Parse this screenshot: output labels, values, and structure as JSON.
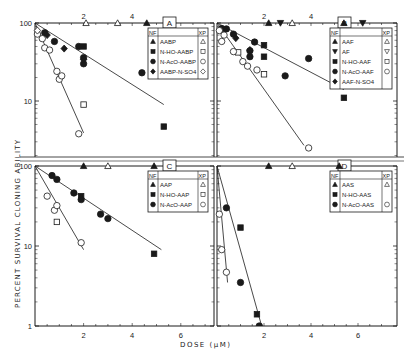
{
  "figure": {
    "ylabel": "PERCENT SURVIVAL CLONING ABILITY",
    "xlabel": "DOSE (μM)"
  },
  "chart_data": [
    {
      "panel": "A",
      "type": "scatter",
      "title": "A",
      "xlabel": "DOSE (μM)",
      "ylabel": "PERCENT SURVIVAL CLONING ABILITY",
      "yscale": "log",
      "xlim": [
        0,
        7.5
      ],
      "ylim": [
        3,
        100
      ],
      "x_ticks_labeled": [
        2,
        4
      ],
      "y_ticks_labeled": [
        10,
        100
      ],
      "legend_headers": [
        "NF",
        "XP"
      ],
      "series": [
        {
          "name": "AABP",
          "cell": "NF",
          "marker": "filled-triangle",
          "x": [
            4.6
          ],
          "y": [
            100
          ]
        },
        {
          "name": "AABP",
          "cell": "XP",
          "marker": "open-triangle",
          "x": [
            2.1,
            3.4
          ],
          "y": [
            100,
            100
          ]
        },
        {
          "name": "N-HO-AABP",
          "cell": "NF",
          "marker": "filled-square",
          "x": [
            2.0,
            5.3
          ],
          "y": [
            50,
            4.7
          ]
        },
        {
          "name": "N-HO-AABP",
          "cell": "XP",
          "marker": "open-square",
          "x": [
            2.0
          ],
          "y": [
            9
          ]
        },
        {
          "name": "N-AcO-AABP",
          "cell": "NF",
          "marker": "filled-circle",
          "x": [
            0.4,
            0.8,
            1.8,
            2.0,
            2.0,
            4.4
          ],
          "y": [
            75,
            58,
            50,
            36,
            30,
            23
          ]
        },
        {
          "name": "N-AcO-AABP",
          "cell": "XP",
          "marker": "open-circle",
          "x": [
            0.1,
            0.3,
            0.4,
            0.6,
            0.9,
            1.0,
            1.1,
            1.8
          ],
          "y": [
            72,
            63,
            48,
            45,
            24,
            19,
            21,
            3.8
          ]
        },
        {
          "name": "AABP-N-SO4",
          "cell": "NF",
          "marker": "filled-diamond",
          "x": [
            0.5,
            1.2,
            2.0
          ],
          "y": [
            70,
            47,
            34
          ]
        },
        {
          "name": "AABP-N-SO4",
          "cell": "XP",
          "marker": "open-diamond",
          "x": [
            0.1
          ],
          "y": [
            80
          ]
        }
      ],
      "fit_lines": [
        {
          "cell": "NF",
          "x": [
            0,
            5.3
          ],
          "y": [
            100,
            9
          ]
        },
        {
          "cell": "XP",
          "x": [
            0,
            2.0
          ],
          "y": [
            100,
            3.9
          ]
        }
      ]
    },
    {
      "panel": "B",
      "type": "scatter",
      "title": "B",
      "yscale": "log",
      "xlim": [
        0,
        7.5
      ],
      "ylim": [
        2,
        100
      ],
      "x_ticks_labeled": [
        2,
        4
      ],
      "legend_headers": [
        "NF",
        "XP"
      ],
      "series": [
        {
          "name": "AAF",
          "cell": "NF",
          "marker": "filled-triangle",
          "x": [
            2.2,
            5.4
          ],
          "y": [
            100,
            100
          ]
        },
        {
          "name": "AAF",
          "cell": "XP",
          "marker": "open-triangle",
          "x": [
            3.2
          ],
          "y": [
            100
          ]
        },
        {
          "name": "AF",
          "cell": "NF",
          "marker": "filled-inverted-triangle",
          "x": [
            2.7,
            6.2
          ],
          "y": [
            100,
            100
          ]
        },
        {
          "name": "AF",
          "cell": "XP",
          "marker": "open-inverted-triangle",
          "x": [],
          "y": []
        },
        {
          "name": "N-HO-AAF",
          "cell": "NF",
          "marker": "filled-square",
          "x": [
            2.0,
            2.0,
            5.4
          ],
          "y": [
            52,
            37,
            11
          ]
        },
        {
          "name": "N-HO-AAF",
          "cell": "XP",
          "marker": "open-square",
          "x": [
            0.9,
            2.0
          ],
          "y": [
            42,
            22
          ]
        },
        {
          "name": "N-AcO-AAF",
          "cell": "NF",
          "marker": "filled-circle",
          "x": [
            0.2,
            0.4,
            0.7,
            1.6,
            1.4,
            1.4,
            2.9,
            3.9
          ],
          "y": [
            85,
            84,
            72,
            57,
            44,
            37,
            21,
            35
          ]
        },
        {
          "name": "N-AcO-AAF",
          "cell": "XP",
          "marker": "open-circle",
          "x": [
            0.1,
            0.3,
            0.2,
            0.7,
            1.1,
            1.3,
            1.7,
            3.9
          ],
          "y": [
            80,
            70,
            58,
            43,
            32,
            28,
            25,
            2.5
          ]
        },
        {
          "name": "AAF-N-SO4",
          "cell": "NF",
          "marker": "filled-diamond",
          "x": [
            0.8,
            1.4
          ],
          "y": [
            64,
            45
          ]
        }
      ],
      "fit_lines": [
        {
          "cell": "NF",
          "x": [
            0,
            5.4
          ],
          "y": [
            100,
            14
          ]
        },
        {
          "cell": "XP",
          "x": [
            0,
            3.7
          ],
          "y": [
            100,
            2.7
          ]
        }
      ]
    },
    {
      "panel": "C",
      "type": "scatter",
      "title": "C",
      "xlabel": "DOSE (μM)",
      "yscale": "log",
      "xlim": [
        0,
        7.5
      ],
      "ylim": [
        1,
        100
      ],
      "x_ticks_labeled": [
        2,
        4,
        6
      ],
      "y_ticks_labeled": [
        1,
        10,
        100
      ],
      "legend_headers": [
        "NF",
        "XP"
      ],
      "series": [
        {
          "name": "AAP",
          "cell": "NF",
          "marker": "filled-triangle",
          "x": [
            2.0,
            4.9
          ],
          "y": [
            100,
            100
          ]
        },
        {
          "name": "AAP",
          "cell": "XP",
          "marker": "open-triangle",
          "x": [
            3.0
          ],
          "y": [
            100
          ]
        },
        {
          "name": "N-HO-AAP",
          "cell": "NF",
          "marker": "filled-square",
          "x": [
            1.9,
            4.9
          ],
          "y": [
            42,
            8
          ]
        },
        {
          "name": "N-HO-AAP",
          "cell": "XP",
          "marker": "open-square",
          "x": [
            0.9
          ],
          "y": [
            20
          ]
        },
        {
          "name": "N-AcO-AAP",
          "cell": "NF",
          "marker": "filled-circle",
          "x": [
            0.7,
            0.9,
            1.6,
            1.9,
            2.7,
            3.0
          ],
          "y": [
            76,
            68,
            46,
            38,
            25,
            22
          ]
        },
        {
          "name": "N-AcO-AAP",
          "cell": "XP",
          "marker": "open-circle",
          "x": [
            0.5,
            0.8,
            0.9,
            1.9
          ],
          "y": [
            42,
            28,
            32,
            11
          ]
        }
      ],
      "fit_lines": [
        {
          "cell": "NF",
          "x": [
            0,
            5.2
          ],
          "y": [
            100,
            9
          ]
        },
        {
          "cell": "XP",
          "x": [
            0,
            2.0
          ],
          "y": [
            100,
            9
          ]
        }
      ]
    },
    {
      "panel": "D",
      "type": "scatter",
      "title": "D",
      "yscale": "log",
      "xlim": [
        0,
        7.5
      ],
      "ylim": [
        1,
        100
      ],
      "x_ticks_labeled": [
        2,
        4,
        6
      ],
      "legend_headers": [
        "NF",
        "XP"
      ],
      "series": [
        {
          "name": "AAS",
          "cell": "NF",
          "marker": "filled-triangle",
          "x": [
            2.2,
            5.2
          ],
          "y": [
            100,
            100
          ]
        },
        {
          "name": "AAS",
          "cell": "XP",
          "marker": "open-triangle",
          "x": [
            3.2
          ],
          "y": [
            100
          ]
        },
        {
          "name": "N-HO-AAS",
          "cell": "NF",
          "marker": "filled-square",
          "x": [
            1.0,
            1.7
          ],
          "y": [
            17,
            1.4
          ]
        },
        {
          "name": "N-AcO-AAS",
          "cell": "NF",
          "marker": "filled-circle",
          "x": [
            0.4,
            1.0,
            1.8
          ],
          "y": [
            30,
            3.5,
            1.0
          ]
        },
        {
          "name": "N-AcO-AAS",
          "cell": "XP",
          "marker": "open-circle",
          "x": [
            0.1,
            0.2,
            0.4
          ],
          "y": [
            25,
            9,
            4.7
          ]
        }
      ],
      "fit_lines": [
        {
          "cell": "NF",
          "x": [
            0,
            1.9
          ],
          "y": [
            100,
            1.0
          ]
        },
        {
          "cell": "XP",
          "x": [
            0,
            0.45
          ],
          "y": [
            100,
            3.5
          ]
        }
      ]
    }
  ],
  "legends": {
    "A": {
      "header_left": "NF",
      "header_right": "XP",
      "items": [
        {
          "label": "AABP",
          "nf": "▲",
          "xp": "△"
        },
        {
          "label": "N-HO-AABP",
          "nf": "■",
          "xp": "□"
        },
        {
          "label": "N-AcO-AABP",
          "nf": "●",
          "xp": "○"
        },
        {
          "label": "AABP-N-SO4",
          "nf": "◆",
          "xp": "◇"
        }
      ]
    },
    "B": {
      "header_left": "NF",
      "header_right": "XP",
      "items": [
        {
          "label": "AAF",
          "nf": "▲",
          "xp": "△"
        },
        {
          "label": "AF",
          "nf": "▼",
          "xp": "▽"
        },
        {
          "label": "N-HO-AAF",
          "nf": "■",
          "xp": "□"
        },
        {
          "label": "N-AcO-AAF",
          "nf": "●",
          "xp": "○"
        },
        {
          "label": "AAF-N-SO4",
          "nf": "◆",
          "xp": ""
        }
      ]
    },
    "C": {
      "header_left": "NF",
      "header_right": "XP",
      "items": [
        {
          "label": "AAP",
          "nf": "▲",
          "xp": "△"
        },
        {
          "label": "N-HO-AAP",
          "nf": "■",
          "xp": "□"
        },
        {
          "label": "N-AcO-AAP",
          "nf": "●",
          "xp": "○"
        }
      ]
    },
    "D": {
      "header_left": "NF",
      "header_right": "XP",
      "items": [
        {
          "label": "AAS",
          "nf": "▲",
          "xp": "△"
        },
        {
          "label": "N-HO-AAS",
          "nf": "■",
          "xp": ""
        },
        {
          "label": "N-AcO-AAS",
          "nf": "●",
          "xp": "○"
        }
      ]
    }
  }
}
